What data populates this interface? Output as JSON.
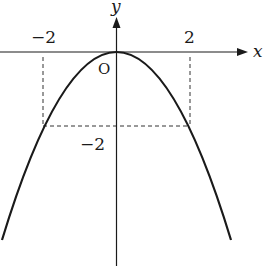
{
  "diagram": {
    "type": "function-graph",
    "function": "y = -x^2/2",
    "axes": {
      "x_label": "x",
      "y_label": "y",
      "origin_label": "O"
    },
    "tick_labels": {
      "x_neg": "−2",
      "x_pos": "2",
      "y_neg": "−2"
    },
    "marked_points": [
      {
        "x": -2,
        "y": -2
      },
      {
        "x": 2,
        "y": -2
      }
    ],
    "colors": {
      "curve": "#1a1a1a",
      "axes": "#1a1a1a",
      "guides": "#333333"
    }
  }
}
